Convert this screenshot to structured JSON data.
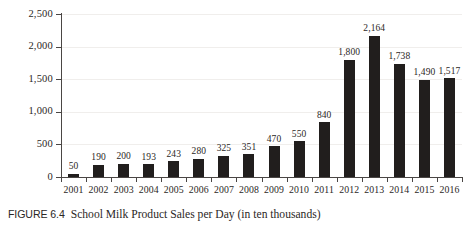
{
  "figure": {
    "number_label": "FIGURE 6.4",
    "caption_title": "School Milk Product Sales per Day (in ten thousands)"
  },
  "chart_data": {
    "type": "bar",
    "title": "School Milk Product Sales per Day (in ten thousands)",
    "xlabel": "",
    "ylabel": "",
    "ylim": [
      0,
      2500
    ],
    "yticks": [
      0,
      500,
      1000,
      1500,
      2000,
      2500
    ],
    "ytick_labels": [
      "0",
      "500",
      "1,000",
      "1,500",
      "2,000",
      "2,500"
    ],
    "grid": true,
    "legend": "none",
    "bar_color": "#211e1d",
    "categories": [
      "2001",
      "2002",
      "2003",
      "2004",
      "2005",
      "2006",
      "2007",
      "2008",
      "2009",
      "2010",
      "2011",
      "2012",
      "2013",
      "2014",
      "2015",
      "2016"
    ],
    "values": [
      50,
      190,
      200,
      193,
      243,
      280,
      325,
      351,
      470,
      550,
      840,
      1800,
      2164,
      1738,
      1490,
      1517
    ],
    "value_labels": [
      "50",
      "190",
      "200",
      "193",
      "243",
      "280",
      "325",
      "351",
      "470",
      "550",
      "840",
      "1,800",
      "2,164",
      "1,738",
      "1,490",
      "1,517"
    ]
  }
}
